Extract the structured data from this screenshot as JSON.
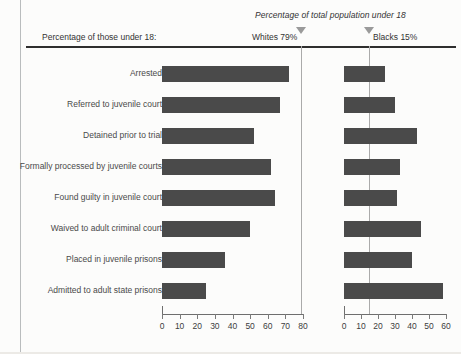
{
  "header": {
    "supertitle": "Percentage of total population under 18",
    "left_caption": "Percentage of those under 18:",
    "whites_marker_label": "Whites 79%",
    "blacks_marker_label": "Blacks 15%"
  },
  "markers": {
    "whites_population_pct": 79,
    "blacks_population_pct": 15
  },
  "colors": {
    "bar": "#4a4a4a",
    "axis": "#6e6e6e",
    "marker": "#9a9a9a",
    "rule": "#2e2e2e",
    "text": "#3a3a3a",
    "background": "#fcfcfb"
  },
  "chart_data": {
    "type": "bar",
    "title": "Percentage of total population under 18",
    "orientation": "horizontal",
    "grid": false,
    "legend_position": "top",
    "xlabel": "",
    "ylabel": "",
    "categories": [
      "Arrested",
      "Referred to juvenile court",
      "Detained prior to trial",
      "Formally processed by juvenile courts",
      "Found guilty in juvenile court",
      "Waived to adult criminal court",
      "Placed in juvenile prisons",
      "Admitted to adult state prisons"
    ],
    "panels": [
      {
        "name": "Whites",
        "marker_label": "Whites 79%",
        "reference_value": 79,
        "xlim": [
          0,
          80
        ],
        "xticks": [
          0,
          10,
          20,
          30,
          40,
          50,
          60,
          70,
          80
        ],
        "values": [
          72,
          67,
          52,
          62,
          64,
          50,
          36,
          25
        ]
      },
      {
        "name": "Blacks",
        "marker_label": "Blacks 15%",
        "reference_value": 15,
        "xlim": [
          0,
          60
        ],
        "xticks": [
          0,
          10,
          20,
          30,
          40,
          50,
          60
        ],
        "values": [
          24,
          30,
          43,
          33,
          31,
          45,
          40,
          58
        ]
      }
    ],
    "series": [
      {
        "name": "Whites",
        "values": [
          72,
          67,
          52,
          62,
          64,
          50,
          36,
          25
        ]
      },
      {
        "name": "Blacks",
        "values": [
          24,
          30,
          43,
          33,
          31,
          45,
          40,
          58
        ]
      }
    ]
  }
}
